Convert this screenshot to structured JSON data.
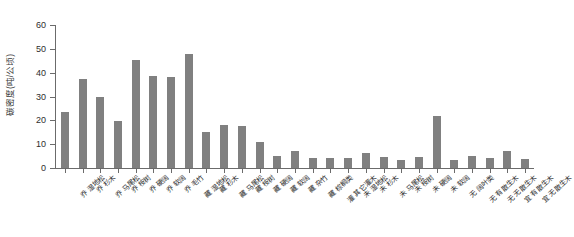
{
  "chart_data": {
    "type": "bar",
    "title": "",
    "xlabel": "",
    "ylabel": "碳密度(吨/公顷)",
    "ylim": [
      0,
      60
    ],
    "yticks": [
      0,
      10,
      20,
      30,
      40,
      50,
      60
    ],
    "grid": false,
    "legend": null,
    "bar_color": "#808080",
    "axis_color": "#6b6b6b",
    "categories": [
      "乔 湿地松",
      "乔 杉木",
      "乔 马尾松",
      "乔 桉树",
      "乔 硬阔",
      "乔 软阔",
      "乔 毛竹",
      "藏 湿地松",
      "藏 杉木",
      "藏 马尾松",
      "藏 桉树",
      "藏 硬阔",
      "藏 软阔",
      "藏 杂竹",
      "藏 棕榈类",
      "灌 其它灌木",
      "未 湿地松",
      "未 杉木",
      "未 马尾松",
      "未 桉树",
      "未 硬阔",
      "未 软阔",
      "无 阔叶类",
      "无 有散生木",
      "无 无散生木",
      "宜 有散生木",
      "宜 无散生木"
    ],
    "values": [
      23.5,
      37.2,
      30.0,
      19.6,
      45.3,
      38.5,
      38.0,
      47.8,
      15.0,
      18.2,
      17.5,
      11.0,
      5.0,
      7.2,
      4.2,
      4.0,
      4.0,
      6.5,
      4.5,
      3.5,
      4.8,
      22.0,
      3.5,
      5.0,
      4.2,
      7.0,
      3.8
    ]
  }
}
